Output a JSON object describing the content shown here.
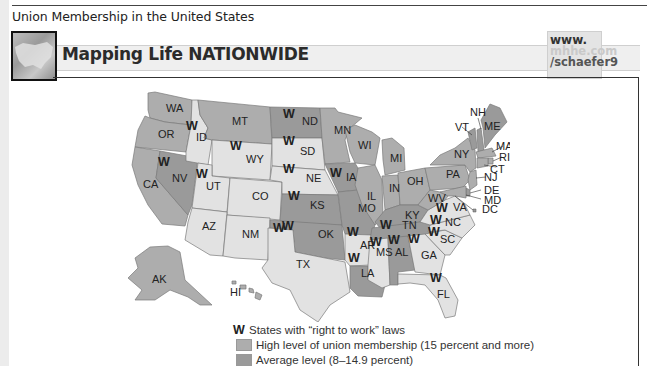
{
  "page": {
    "title": "Union Membership in the United States"
  },
  "banner": {
    "title": "Mapping Life NATIONWIDE",
    "url_lines": [
      "www.",
      "mhhe.com",
      "/schaefer9"
    ]
  },
  "colors": {
    "high": "#adadad",
    "average": "#9a9a9a",
    "low": "#e2e2e2",
    "border": "#7a7a7a",
    "text": "#222222"
  },
  "map": {
    "right_to_work_marker": "W",
    "states": {
      "WA": {
        "level": "high",
        "rtw": false
      },
      "OR": {
        "level": "high",
        "rtw": false
      },
      "CA": {
        "level": "high",
        "rtw": false
      },
      "NV": {
        "level": "average",
        "rtw": true
      },
      "ID": {
        "level": "low",
        "rtw": true
      },
      "MT": {
        "level": "high",
        "rtw": false
      },
      "WY": {
        "level": "low",
        "rtw": true
      },
      "UT": {
        "level": "low",
        "rtw": true
      },
      "CO": {
        "level": "low",
        "rtw": false
      },
      "AZ": {
        "level": "low",
        "rtw": false
      },
      "NM": {
        "level": "low",
        "rtw": false
      },
      "ND": {
        "level": "average",
        "rtw": true
      },
      "SD": {
        "level": "low",
        "rtw": true
      },
      "NE": {
        "level": "low",
        "rtw": true
      },
      "KS": {
        "level": "average",
        "rtw": true
      },
      "OK": {
        "level": "average",
        "rtw": true
      },
      "TX": {
        "level": "low",
        "rtw": true
      },
      "MN": {
        "level": "high",
        "rtw": false
      },
      "IA": {
        "level": "average",
        "rtw": true
      },
      "MO": {
        "level": "average",
        "rtw": false
      },
      "AR": {
        "level": "low",
        "rtw": true
      },
      "LA": {
        "level": "average",
        "rtw": true
      },
      "WI": {
        "level": "high",
        "rtw": false
      },
      "IL": {
        "level": "high",
        "rtw": false
      },
      "MI": {
        "level": "high",
        "rtw": false
      },
      "IN": {
        "level": "high",
        "rtw": false
      },
      "OH": {
        "level": "high",
        "rtw": false
      },
      "KY": {
        "level": "average",
        "rtw": false
      },
      "TN": {
        "level": "average",
        "rtw": true
      },
      "MS": {
        "level": "low",
        "rtw": true
      },
      "AL": {
        "level": "average",
        "rtw": true
      },
      "GA": {
        "level": "low",
        "rtw": true
      },
      "FL": {
        "level": "low",
        "rtw": true
      },
      "SC": {
        "level": "low",
        "rtw": true
      },
      "NC": {
        "level": "low",
        "rtw": true
      },
      "VA": {
        "level": "low",
        "rtw": true
      },
      "WV": {
        "level": "high",
        "rtw": false
      },
      "PA": {
        "level": "high",
        "rtw": false
      },
      "NY": {
        "level": "high",
        "rtw": false
      },
      "VT": {
        "level": "average",
        "rtw": false
      },
      "NH": {
        "level": "average",
        "rtw": false
      },
      "ME": {
        "level": "average",
        "rtw": false
      },
      "MA": {
        "level": "high",
        "rtw": false
      },
      "RI": {
        "level": "high",
        "rtw": false
      },
      "CT": {
        "level": "high",
        "rtw": false
      },
      "NJ": {
        "level": "high",
        "rtw": false
      },
      "DE": {
        "level": "average",
        "rtw": false
      },
      "MD": {
        "level": "high",
        "rtw": false
      },
      "DC": {
        "level": "average",
        "rtw": false
      },
      "AK": {
        "level": "high",
        "rtw": false
      },
      "HI": {
        "level": "high",
        "rtw": false
      }
    }
  },
  "legend": {
    "rtw_marker": "W",
    "rtw_label": "States with “right to work” laws",
    "high_label": "High level of union membership (15 percent and more)",
    "average_label": "Average level (8–14.9 percent)"
  }
}
